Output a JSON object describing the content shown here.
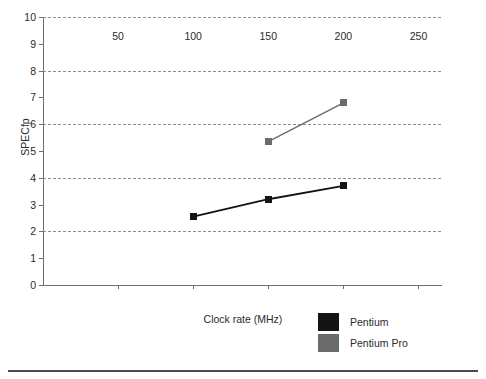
{
  "chart_data": {
    "type": "line",
    "title": "",
    "xlabel": "Clock rate (MHz)",
    "ylabel": "SPECfp",
    "xlim": [
      0,
      265
    ],
    "ylim": [
      0,
      10
    ],
    "grid": "horizontal-dashed-at-even-values",
    "legend_position": "bottom-right",
    "x_ticks": [
      50,
      100,
      150,
      200,
      250
    ],
    "y_ticks": [
      0,
      1,
      2,
      3,
      4,
      5,
      6,
      7,
      8,
      9,
      10
    ],
    "gridline_values": [
      2,
      4,
      6,
      8,
      10
    ],
    "series": [
      {
        "name": "Pentium",
        "color": "#141414",
        "marker": "square",
        "x": [
          100,
          150,
          200
        ],
        "values": [
          2.55,
          3.2,
          3.7
        ]
      },
      {
        "name": "Pentium Pro",
        "color": "#6b6b6b",
        "marker": "square",
        "x": [
          150,
          200
        ],
        "values": [
          5.35,
          6.8
        ]
      }
    ]
  },
  "axes": {
    "y_label": "SPECfp",
    "x_label": "Clock rate (MHz)",
    "y_tick_labels": [
      "0",
      "1",
      "2",
      "3",
      "4",
      "5",
      "6",
      "7",
      "8",
      "9",
      "10"
    ],
    "x_tick_labels": [
      "50",
      "100",
      "150",
      "200",
      "250"
    ]
  },
  "legend": {
    "items": [
      {
        "label": "Pentium",
        "color": "#141414"
      },
      {
        "label": "Pentium Pro",
        "color": "#6b6b6b"
      }
    ]
  },
  "colors": {
    "axis": "#6e6e6e",
    "grid": "#8d8d8d",
    "text": "#2b2b2b",
    "rule": "#4a4a4a",
    "background": "#ffffff"
  }
}
